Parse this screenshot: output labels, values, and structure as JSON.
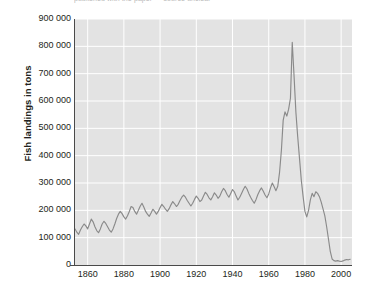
{
  "caption": {
    "text": "published with the paper — source unclear"
  },
  "axes": {
    "ylabel": "Fish landings in tons",
    "xlabel": "",
    "yticks": [
      "0",
      "100 000",
      "200 000",
      "300 000",
      "400 000",
      "500 000",
      "600 000",
      "700 000",
      "800 000",
      "900 000"
    ],
    "xticks": [
      "1860",
      "1880",
      "1900",
      "1920",
      "1940",
      "1960",
      "1980",
      "2000"
    ]
  },
  "style": {
    "plot_background": "#e3e3e3",
    "gridline_color": "#ffffff",
    "line_color": "#8a8a8a",
    "text_color": "#231f20"
  },
  "chart_data": {
    "type": "line",
    "title": "",
    "xlabel": "",
    "ylabel": "Fish landings in tons",
    "xlim": [
      1853,
      2006
    ],
    "ylim": [
      0,
      900000
    ],
    "ytick_values": [
      0,
      100000,
      200000,
      300000,
      400000,
      500000,
      600000,
      700000,
      800000,
      900000
    ],
    "xtick_values": [
      1860,
      1880,
      1900,
      1920,
      1940,
      1960,
      1980,
      2000
    ],
    "grid": true,
    "legend": "none",
    "series": [
      {
        "name": "Fish landings",
        "x": [
          1853,
          1854,
          1855,
          1856,
          1857,
          1858,
          1859,
          1860,
          1861,
          1862,
          1863,
          1864,
          1865,
          1866,
          1867,
          1868,
          1869,
          1870,
          1871,
          1872,
          1873,
          1874,
          1875,
          1876,
          1877,
          1878,
          1879,
          1880,
          1881,
          1882,
          1883,
          1884,
          1885,
          1886,
          1887,
          1888,
          1889,
          1890,
          1891,
          1892,
          1893,
          1894,
          1895,
          1896,
          1897,
          1898,
          1899,
          1900,
          1901,
          1902,
          1903,
          1904,
          1905,
          1906,
          1907,
          1908,
          1909,
          1910,
          1911,
          1912,
          1913,
          1914,
          1915,
          1916,
          1917,
          1918,
          1919,
          1920,
          1921,
          1922,
          1923,
          1924,
          1925,
          1926,
          1927,
          1928,
          1929,
          1930,
          1931,
          1932,
          1933,
          1934,
          1935,
          1936,
          1937,
          1938,
          1939,
          1940,
          1941,
          1942,
          1943,
          1944,
          1945,
          1946,
          1947,
          1948,
          1949,
          1950,
          1951,
          1952,
          1953,
          1954,
          1955,
          1956,
          1957,
          1958,
          1959,
          1960,
          1961,
          1962,
          1963,
          1964,
          1965,
          1966,
          1967,
          1968,
          1969,
          1970,
          1971,
          1972,
          1973,
          1974,
          1975,
          1976,
          1977,
          1978,
          1979,
          1980,
          1981,
          1982,
          1983,
          1984,
          1985,
          1986,
          1987,
          1988,
          1989,
          1990,
          1991,
          1992,
          1993,
          1994,
          1995,
          1996,
          1997,
          1998,
          1999,
          2000,
          2001,
          2002,
          2003,
          2004,
          2005
        ],
        "y": [
          132000,
          120000,
          112000,
          128000,
          140000,
          150000,
          143000,
          132000,
          150000,
          168000,
          158000,
          140000,
          126000,
          118000,
          132000,
          150000,
          160000,
          152000,
          140000,
          128000,
          120000,
          132000,
          150000,
          170000,
          186000,
          196000,
          188000,
          176000,
          168000,
          180000,
          196000,
          214000,
          210000,
          196000,
          186000,
          200000,
          215000,
          226000,
          212000,
          196000,
          186000,
          178000,
          190000,
          204000,
          196000,
          186000,
          196000,
          210000,
          222000,
          214000,
          204000,
          196000,
          206000,
          220000,
          232000,
          224000,
          214000,
          222000,
          236000,
          248000,
          256000,
          248000,
          236000,
          226000,
          216000,
          226000,
          240000,
          252000,
          244000,
          232000,
          238000,
          252000,
          266000,
          258000,
          246000,
          238000,
          250000,
          264000,
          256000,
          244000,
          252000,
          268000,
          280000,
          272000,
          258000,
          248000,
          262000,
          276000,
          268000,
          252000,
          238000,
          248000,
          262000,
          276000,
          288000,
          278000,
          262000,
          248000,
          236000,
          226000,
          240000,
          258000,
          272000,
          282000,
          270000,
          256000,
          246000,
          260000,
          282000,
          300000,
          286000,
          272000,
          288000,
          340000,
          420000,
          530000,
          560000,
          545000,
          570000,
          610000,
          815000,
          690000,
          560000,
          470000,
          390000,
          310000,
          250000,
          196000,
          176000,
          200000,
          238000,
          262000,
          250000,
          268000,
          262000,
          250000,
          230000,
          205000,
          180000,
          140000,
          95000,
          50000,
          22000,
          16000,
          14000,
          16000,
          14000,
          13000,
          15000,
          18000,
          20000,
          19000,
          21000
        ]
      }
    ]
  }
}
